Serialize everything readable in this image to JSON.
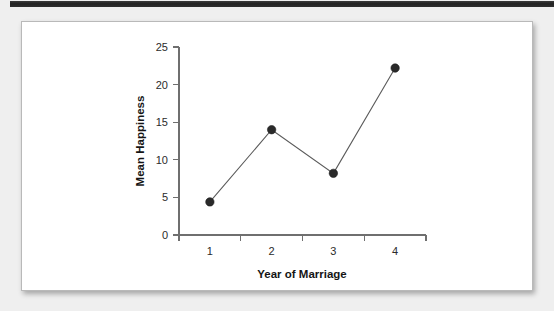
{
  "page": {
    "background_color": "#efefef",
    "top_band_color": "#2a2a2a"
  },
  "figure": {
    "card_background": "#ffffff",
    "card_border_color": "#b9b9b9"
  },
  "chart_data": {
    "type": "line",
    "title": "",
    "xlabel": "Year of Marriage",
    "ylabel": "Mean Happiness",
    "categories": [
      "1",
      "2",
      "3",
      "4"
    ],
    "x": [
      1,
      2,
      3,
      4
    ],
    "values": [
      4.4,
      14.0,
      8.2,
      22.2
    ],
    "series": [
      {
        "name": "Mean Happiness",
        "values": [
          4.4,
          14.0,
          8.2,
          22.2
        ]
      }
    ],
    "ylim": [
      0,
      25
    ],
    "yticks": [
      0,
      5,
      10,
      15,
      20,
      25
    ],
    "ytick_labels": [
      "0",
      "5",
      "10",
      "15",
      "20",
      "25"
    ],
    "xticks": [
      1,
      2,
      3,
      4
    ],
    "xtick_labels": [
      "1",
      "2",
      "3",
      "4"
    ],
    "grid": false,
    "legend": false,
    "legend_position": "none",
    "line_color": "#5b5b5b",
    "marker_color": "#2a2a2a",
    "marker_shape": "circle",
    "axis_color": "#6f6f6f"
  }
}
